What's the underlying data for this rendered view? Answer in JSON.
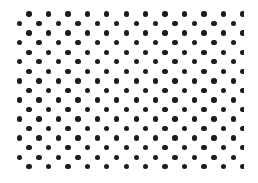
{
  "pattern": {
    "type": "polka-dot",
    "dot_color": "#1c1c1c",
    "background_color": "#ffffff",
    "dot_diameter": 5.4,
    "rows": 17,
    "dots_per_row": 12,
    "row_spacing": 9.55,
    "col_spacing": 19.45,
    "first_row_y": 14,
    "odd_row_start_x": 29,
    "even_row_start_x": 19.5,
    "clip_right_x": 244
  }
}
